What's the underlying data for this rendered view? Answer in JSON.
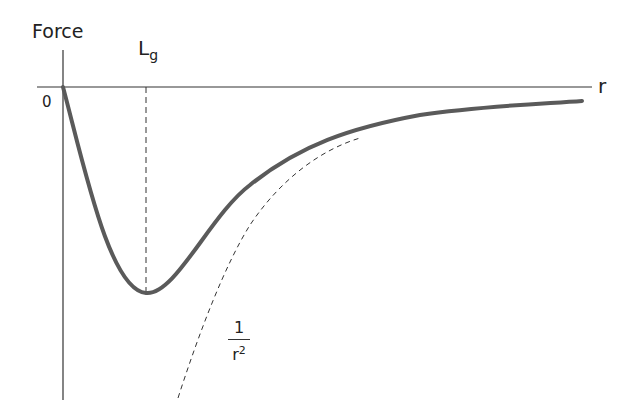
{
  "diagram": {
    "y_axis_label": "Force",
    "x_axis_label": "r",
    "origin_label": "0",
    "marker_label": {
      "main": "L",
      "sub": "g"
    },
    "asymptote_label": {
      "numerator": "1",
      "denominator": "r",
      "exponent": "2"
    },
    "colors": {
      "curve": "#5a5a5a",
      "axis": "#333333",
      "dashed": "#333333"
    }
  }
}
